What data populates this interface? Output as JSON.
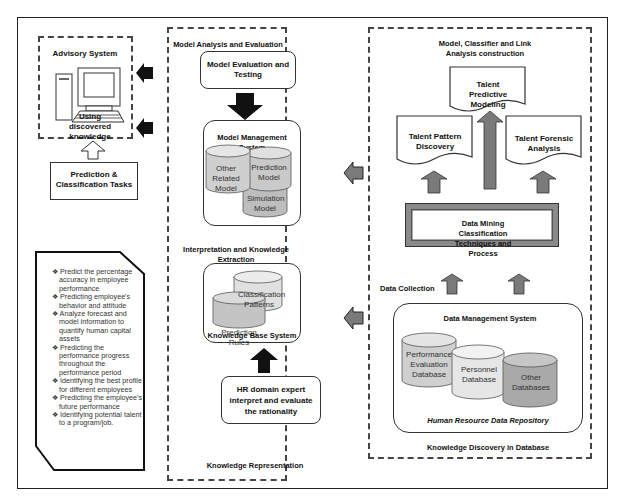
{
  "advisory": {
    "title": "Advisory System",
    "subtitle": "Using discovered knowledge",
    "tasks_box": "Prediction & Classification Tasks"
  },
  "tasks_list": {
    "items": [
      "Predict the percentage accuracy in employee performance",
      "Predicting employee's behavior and attitude",
      "Analyze forecast and model information to quantify human capital assets",
      "Predicting the performance progress throughout the performance period",
      "Identifying the best profile for different employees",
      "Predicting the employee's future performance",
      "Identifying potential talent to a program/job."
    ]
  },
  "middle": {
    "section_title": "Model Analysis and Evaluation",
    "evaluation_box": "Model Evaluation and Testing",
    "mms_title": "Model Management System",
    "mms_cylinders": [
      "Other Related Model",
      "Prediction Model",
      "Simulation Model"
    ],
    "interp_title": "Interpretation and Knowledge Extraction",
    "kbs_cylinders": [
      "Classification Patterns",
      "Prediction Rules"
    ],
    "kbs_title": "Knowledge Base System",
    "hr_box": "HR domain expert interpret and evaluate the rationality",
    "bottom_label": "Knowledge Representation"
  },
  "right": {
    "section_title": "Model, Classifier and Link Analysis construction",
    "doc_predictive": "Talent Predictive Modeling",
    "doc_pattern": "Talent Pattern Discovery",
    "doc_forensic": "Talent Forensic Analysis",
    "dm_box": "Data Mining Classification Techniques and Process",
    "data_collection": "Data Collection",
    "dms_title": "Data Management System",
    "dms_cylinders": [
      "Performance Evaluation Database",
      "Personnel Database",
      "Other Databases"
    ],
    "repository": "Human Resource Data Repository",
    "bottom_label": "Knowledge Discovery in Database"
  },
  "colors": {
    "cyl_light": "#e6e6e6",
    "cyl_mid": "#cfcfcf",
    "cyl_dark": "#a9a9a9",
    "arrow_gray": "#7a7a7a",
    "arrow_black": "#111111"
  }
}
